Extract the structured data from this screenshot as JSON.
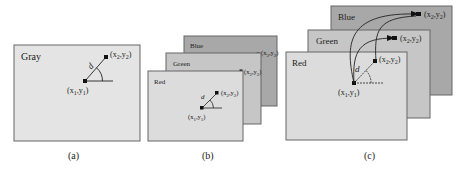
{
  "figure": {
    "panels": [
      {
        "id": "a",
        "caption": "(a)",
        "layers": [
          {
            "name": "Gray",
            "label": "Gray",
            "fill": "#e4e4e4",
            "rect": [
              14,
              45,
              126,
              96
            ],
            "p1": [
              85,
              81
            ],
            "p2": [
              106,
              57
            ],
            "p1_label": "(x1,y1)",
            "p2_label": "(x2,y2)",
            "d_label": "d"
          }
        ]
      },
      {
        "id": "b",
        "caption": "(b)",
        "layers": [
          {
            "name": "Blue",
            "label": "Blue",
            "fill": "#a8a8a8",
            "rect": [
              184,
              36,
              93,
              70
            ],
            "p1": [
              245,
              67
            ],
            "p2": [
              258,
              54
            ],
            "p1_label": "",
            "p2_label": "(x2,y2)",
            "d_label": "d"
          },
          {
            "name": "Green",
            "label": "Green",
            "fill": "#c6c6c6",
            "rect": [
              166,
              53,
              95,
              71
            ],
            "p1": [
              228,
              85
            ],
            "p2": [
              241,
              71
            ],
            "p1_label": "",
            "p2_label": "(x2,y2)",
            "d_label": "d"
          },
          {
            "name": "Red",
            "label": "Red",
            "fill": "#dcdcdc",
            "rect": [
              148,
              71,
              95,
              70
            ],
            "p1": [
              202,
              108
            ],
            "p2": [
              217,
              93
            ],
            "p1_label": "(x1,y1)",
            "p2_label": "(x2,y2)",
            "d_label": "d"
          }
        ]
      },
      {
        "id": "c",
        "caption": "(c)",
        "layers": [
          {
            "name": "Blue",
            "label": "Blue",
            "fill": "#a8a8a8",
            "rect": [
              331,
              6,
              121,
              89
            ],
            "p2": [
              419,
              14
            ],
            "p2_label": "(x2,y2)"
          },
          {
            "name": "Green",
            "label": "Green",
            "fill": "#c6c6c6",
            "rect": [
              308,
              30,
              122,
              88
            ],
            "p2": [
              395,
              38
            ],
            "p2_label": "(x2,y2)"
          },
          {
            "name": "Red",
            "label": "Red",
            "fill": "#dcdcdc",
            "rect": [
              286,
              52,
              121,
              88
            ],
            "p1": [
              354,
              83
            ],
            "p2": [
              375,
              61
            ],
            "p1_label": "(x1,y1)",
            "p2_label": "(x2,y2)",
            "d_label": "d"
          }
        ]
      }
    ],
    "border_color": "#666666"
  },
  "labels": {
    "a_caption": "(a)",
    "b_caption": "(b)",
    "c_caption": "(c)",
    "gray": "Gray",
    "red": "Red",
    "green": "Green",
    "blue": "Blue",
    "d": "d"
  }
}
